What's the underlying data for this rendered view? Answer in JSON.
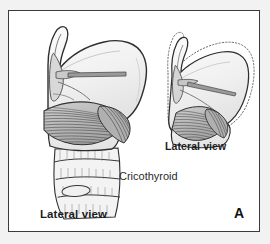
{
  "figure": {
    "panel_letter": "A",
    "subject": "Cricothyroid",
    "labels": {
      "lateral_view_left": "Lateral view",
      "lateral_view_right": "Lateral view",
      "muscle_name": "Cricothyroid"
    },
    "colors": {
      "plate_background": "#f2f2f2",
      "canvas_background": "#ffffff",
      "frame_border": "#3b3b3b",
      "outline_stroke": "#2e2e2e",
      "cartilage_fill": "#f4f4f4",
      "cartilage_fill_shaded": "#e3e3e3",
      "muscle_fill": "#b9b9b9",
      "muscle_fiber": "#4a4a4a",
      "ligament_fill": "#9a9a9a",
      "ghost_outline": "#6e6e6e",
      "text": "#1d1d1d"
    }
  }
}
